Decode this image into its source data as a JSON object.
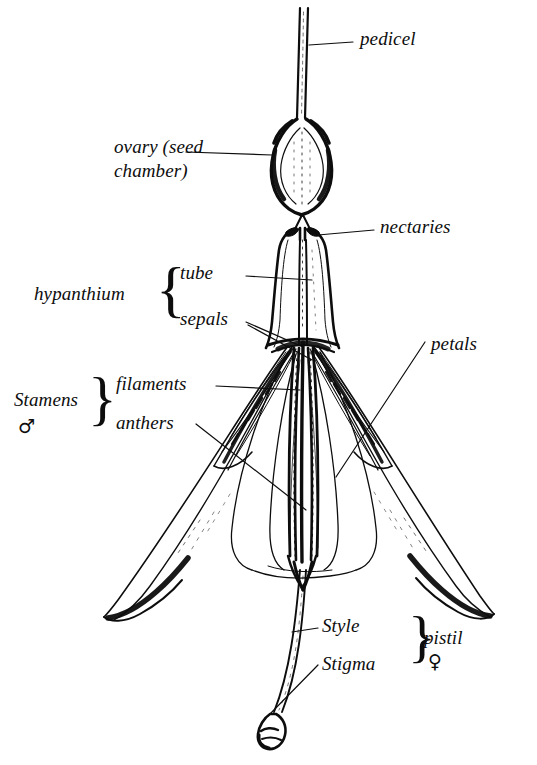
{
  "figure": {
    "style": "line-drawing",
    "background_color": "#ffffff",
    "ink_color": "#0d0d0d"
  },
  "labels": {
    "pedicel": "pedicel",
    "ovary": "ovary (seed",
    "ovary_line2": "chamber)",
    "nectaries": "nectaries",
    "hypanthium": "hypanthium",
    "tube": "tube",
    "sepals": "sepals",
    "petals": "petals",
    "stamens": "Stamens",
    "filaments": "filaments",
    "anthers": "anthers",
    "style": "Style",
    "stigma": "Stigma",
    "pistil": "pistil"
  },
  "symbols": {
    "male": "♂",
    "female": "♀"
  },
  "braces": {
    "hypanthium_brace": "{",
    "stamens_brace": "}",
    "pistil_brace": "}"
  },
  "parts": [
    {
      "name": "pedicel",
      "description": "slender stalk at top"
    },
    {
      "name": "ovary",
      "description": "swollen seed chamber below pedicel"
    },
    {
      "name": "nectaries",
      "description": "dark glands at top of hypanthium tube"
    },
    {
      "name": "hypanthium-tube",
      "description": "flaring floral tube"
    },
    {
      "name": "sepals",
      "description": "four long reflexed sepals"
    },
    {
      "name": "petals",
      "description": "bell of petals in centre"
    },
    {
      "name": "stamens",
      "description": "filaments bearing anthers"
    },
    {
      "name": "pistil",
      "description": "style ending in stigma"
    }
  ]
}
